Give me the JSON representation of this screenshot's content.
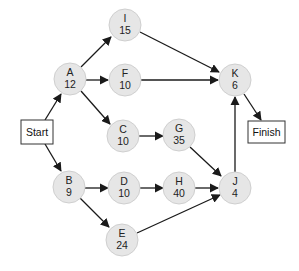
{
  "diagram": {
    "type": "activity-on-node network",
    "start": {
      "label": "Start"
    },
    "finish": {
      "label": "Finish"
    },
    "nodes": [
      {
        "id": "A",
        "duration": "12"
      },
      {
        "id": "B",
        "duration": "9"
      },
      {
        "id": "C",
        "duration": "10"
      },
      {
        "id": "D",
        "duration": "10"
      },
      {
        "id": "E",
        "duration": "24"
      },
      {
        "id": "F",
        "duration": "10"
      },
      {
        "id": "G",
        "duration": "35"
      },
      {
        "id": "H",
        "duration": "40"
      },
      {
        "id": "I",
        "duration": "15"
      },
      {
        "id": "J",
        "duration": "4"
      },
      {
        "id": "K",
        "duration": "6"
      }
    ],
    "edges": [
      [
        "Start",
        "A"
      ],
      [
        "Start",
        "B"
      ],
      [
        "A",
        "I"
      ],
      [
        "A",
        "F"
      ],
      [
        "A",
        "C"
      ],
      [
        "B",
        "D"
      ],
      [
        "B",
        "E"
      ],
      [
        "C",
        "G"
      ],
      [
        "D",
        "H"
      ],
      [
        "I",
        "K"
      ],
      [
        "F",
        "K"
      ],
      [
        "G",
        "J"
      ],
      [
        "H",
        "J"
      ],
      [
        "E",
        "J"
      ],
      [
        "J",
        "K"
      ],
      [
        "K",
        "Finish"
      ]
    ],
    "colors": {
      "node_fill": "#e6e6e6",
      "node_stroke": "#cfcfcf",
      "edge": "#1a1a1a"
    }
  }
}
